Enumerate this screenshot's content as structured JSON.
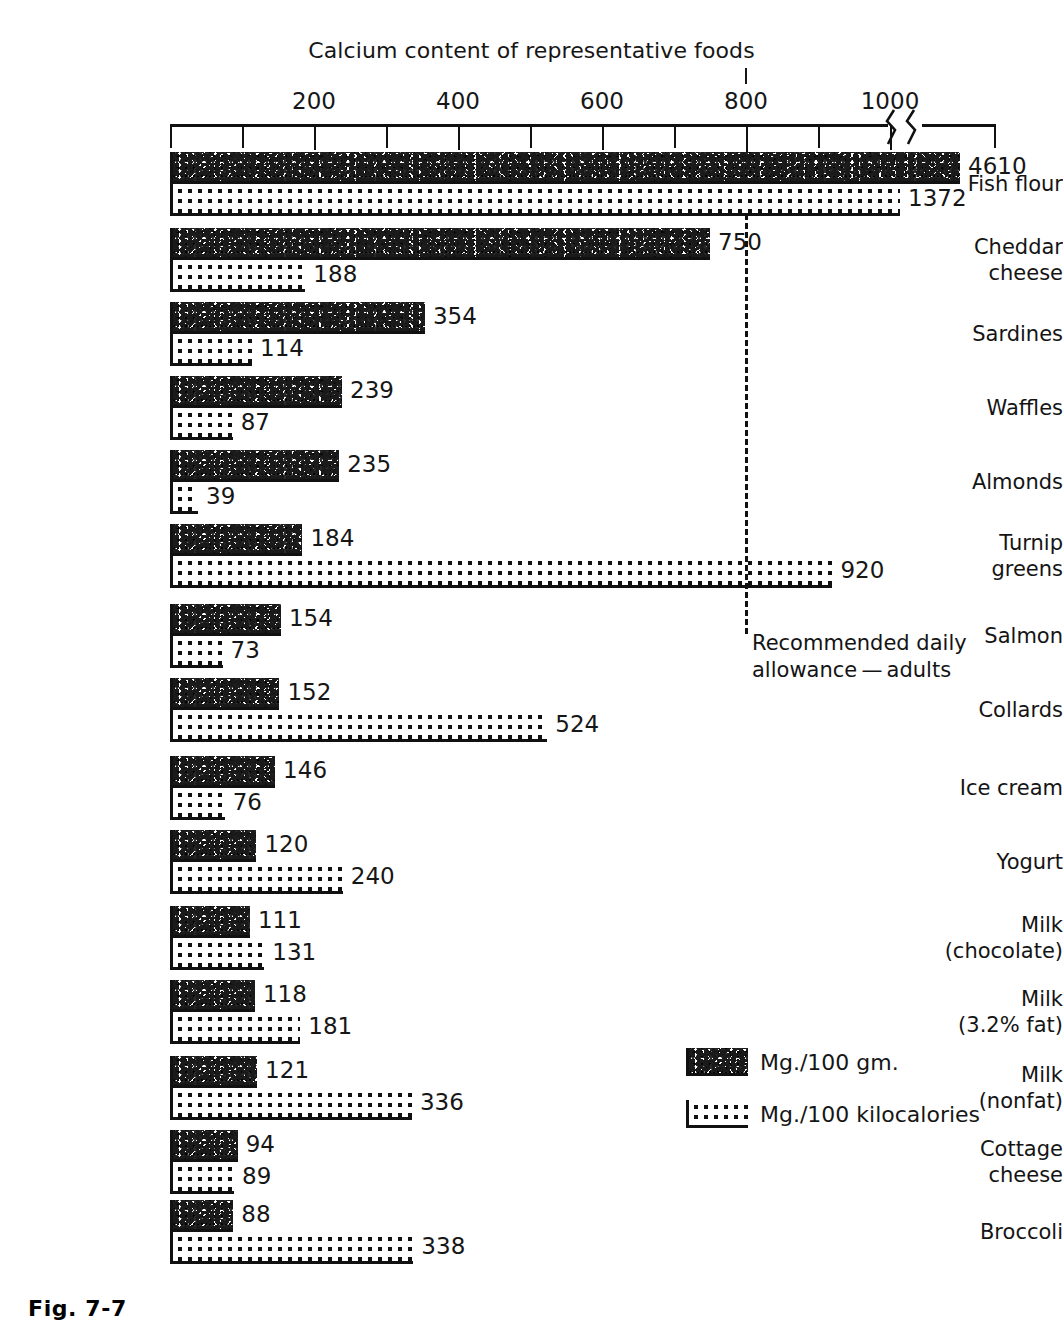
{
  "chart_data": {
    "type": "bar",
    "orientation": "horizontal",
    "title": "Calcium content of representative foods",
    "xlabel": "",
    "ylabel": "",
    "grid": false,
    "axis_ticks_labeled": [
      200,
      400,
      600,
      800,
      1000
    ],
    "axis_ticks_all": [
      0,
      100,
      200,
      300,
      400,
      500,
      600,
      700,
      800,
      900,
      1000
    ],
    "xlim": [
      0,
      1000
    ],
    "axis_break": true,
    "axis_break_note": "scale broken after 1000; Fish flour bars extend beyond break",
    "legend_position": "lower-right",
    "series": [
      {
        "name": "Mg./100 gm.",
        "fill": "speckle",
        "values": [
          4610,
          750,
          354,
          239,
          235,
          184,
          154,
          152,
          146,
          120,
          111,
          118,
          121,
          94,
          88
        ]
      },
      {
        "name": "Mg./100 kilocalories",
        "fill": "dots",
        "values": [
          1372,
          188,
          114,
          87,
          39,
          920,
          73,
          524,
          76,
          240,
          131,
          181,
          336,
          89,
          338
        ]
      }
    ],
    "categories": [
      "Fish flour",
      "Cheddar cheese",
      "Sardines",
      "Waffles",
      "Almonds",
      "Turnip greens",
      "Salmon",
      "Collards",
      "Ice cream",
      "Yogurt",
      "Milk (chocolate)",
      "Milk (3.2% fat)",
      "Milk (nonfat)",
      "Cottage cheese",
      "Broccoli"
    ],
    "annotations": [
      {
        "label": "Recommended daily allowance — adults",
        "x_value": 800,
        "style": "dashed-vertical-line"
      }
    ]
  },
  "axis": {
    "labels": [
      "200",
      "400",
      "600",
      "800",
      "1000"
    ]
  },
  "rows": [
    {
      "label": "Fish flour",
      "top": 152,
      "gm": 4610,
      "kcal": 1372
    },
    {
      "label": "Cheddar\ncheese",
      "top": 228,
      "gm": 750,
      "kcal": 188
    },
    {
      "label": "Sardines",
      "top": 302,
      "gm": 354,
      "kcal": 114
    },
    {
      "label": "Waffles",
      "top": 376,
      "gm": 239,
      "kcal": 87
    },
    {
      "label": "Almonds",
      "top": 450,
      "gm": 235,
      "kcal": 39
    },
    {
      "label": "Turnip\ngreens",
      "top": 524,
      "gm": 184,
      "kcal": 920
    },
    {
      "label": "Salmon",
      "top": 604,
      "gm": 154,
      "kcal": 73
    },
    {
      "label": "Collards",
      "top": 678,
      "gm": 152,
      "kcal": 524
    },
    {
      "label": "Ice cream",
      "top": 756,
      "gm": 146,
      "kcal": 76
    },
    {
      "label": "Yogurt",
      "top": 830,
      "gm": 120,
      "kcal": 240
    },
    {
      "label": "Milk\n(chocolate)",
      "top": 906,
      "gm": 111,
      "kcal": 131
    },
    {
      "label": "Milk\n(3.2% fat)",
      "top": 980,
      "gm": 118,
      "kcal": 181
    },
    {
      "label": "Milk\n(nonfat)",
      "top": 1056,
      "gm": 121,
      "kcal": 336
    },
    {
      "label": "Cottage\ncheese",
      "top": 1130,
      "gm": 94,
      "kcal": 89
    },
    {
      "label": "Broccoli",
      "top": 1200,
      "gm": 88,
      "kcal": 338
    }
  ],
  "rda": {
    "note": "Recommended daily\nallowance — adults",
    "value": 800
  },
  "legend": {
    "items": [
      {
        "label": "Mg./100 gm.",
        "fill": "speckle"
      },
      {
        "label": "Mg./100 kilocalories",
        "fill": "dots"
      }
    ]
  },
  "caption": {
    "text": "Fig. 7-7"
  }
}
